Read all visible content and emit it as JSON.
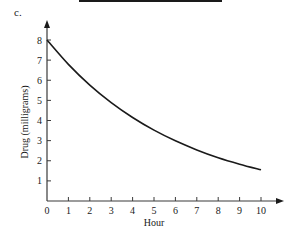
{
  "part_label": "c.",
  "chart_data": {
    "type": "line",
    "title": "",
    "xlabel": "Hour",
    "ylabel": "Drug (milligrams)",
    "xlim": [
      0,
      10
    ],
    "ylim": [
      0,
      8
    ],
    "x_ticks": [
      0,
      1,
      2,
      3,
      4,
      5,
      6,
      7,
      8,
      9,
      10
    ],
    "y_ticks": [
      1,
      2,
      3,
      4,
      5,
      6,
      7,
      8
    ],
    "grid": false,
    "legend": "none",
    "series": [
      {
        "name": "Drug remaining",
        "x": [
          0,
          1,
          2,
          3,
          4,
          5,
          6,
          7,
          8,
          9,
          10
        ],
        "y": [
          8.0,
          6.79,
          5.76,
          4.89,
          4.15,
          3.52,
          2.99,
          2.54,
          2.15,
          1.83,
          1.55
        ]
      }
    ]
  }
}
